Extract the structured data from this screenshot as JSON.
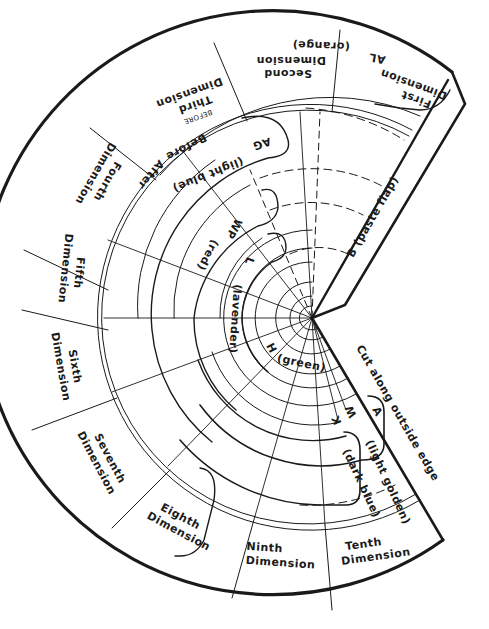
{
  "diagram": {
    "type": "cut-out cone template (tenth dimension wheel)",
    "colors": {
      "ink": "#1a1a1a",
      "paper": "#ffffff"
    },
    "dimensions": [
      {
        "id": 1,
        "line1": "First",
        "line2": "Dimension"
      },
      {
        "id": 2,
        "line1": "Second",
        "line2": "Dimension"
      },
      {
        "id": 3,
        "line1": "Third",
        "line2": "Dimension",
        "note": "BEFORE"
      },
      {
        "id": 4,
        "line1": "Fourth",
        "line2": "Dimension"
      },
      {
        "id": 5,
        "line1": "Fifth",
        "line2": "Dimension"
      },
      {
        "id": 6,
        "line1": "Sixth",
        "line2": "Dimension"
      },
      {
        "id": 7,
        "line1": "Seventh",
        "line2": "Dimension"
      },
      {
        "id": 8,
        "line1": "Eighth",
        "line2": "Dimension"
      },
      {
        "id": 9,
        "line1": "Ninth",
        "line2": "Dimension"
      },
      {
        "id": 10,
        "line1": "Tenth",
        "line2": "Dimension"
      }
    ],
    "before_after": {
      "before": "Before",
      "after": "After"
    },
    "lanes": [
      {
        "code": "AL",
        "color": "(orange)"
      },
      {
        "code": "AG",
        "color": "(light blue)"
      },
      {
        "code": "WP",
        "color": "(red)"
      },
      {
        "code": "L",
        "color": "(lavender)"
      },
      {
        "code": "H",
        "color": "(green)"
      },
      {
        "code": "W",
        "color": "(light golden)"
      },
      {
        "code": "K",
        "color": "(dark blue)"
      }
    ],
    "edge_labels": {
      "flap": "B  (paste  flap)",
      "cut": "Cut along outside edge",
      "a_mark": "A"
    }
  }
}
